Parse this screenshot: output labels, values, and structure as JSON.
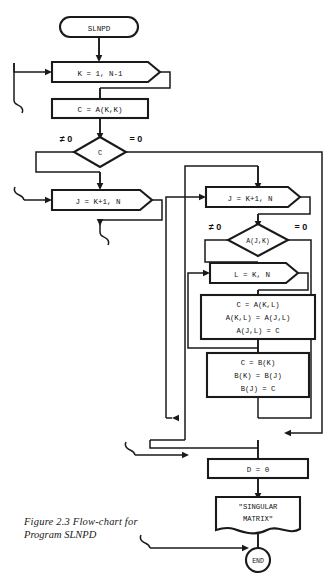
{
  "figure": {
    "caption_line1": "Figure 2.3    Flow-chart for",
    "caption_line2": "Program SLNPD",
    "title": "Flow-chart for Program SLNPD"
  },
  "colors": {
    "ink": "#1a1a1a",
    "paper": "#ffffff"
  },
  "nodes": {
    "start": "SLNPD",
    "loop_k": "K = 1, N-1",
    "assign_c": "C = A(K,K)",
    "decision_c": "C",
    "loop_j_left": "J = K+1, N",
    "loop_j_right": "J = K+1, N",
    "decision_ajk": "A(J,K)",
    "loop_l": "L = K, N",
    "swap_a_1": "C = A(K,L)",
    "swap_a_2": "A(K,L) = A(J,L)",
    "swap_a_3": "A(J,L) = C",
    "swap_b_1": "C = B(K)",
    "swap_b_2": "B(K) = B(J)",
    "swap_b_3": "B(J) = C",
    "assign_d": "D = 0",
    "output_line1": "\"SINGULAR",
    "output_line2": "MATRIX\"",
    "end": "END"
  },
  "branch_labels": {
    "c_not_zero": "≠ 0",
    "c_zero": "= 0",
    "ajk_not_zero": "≠ 0",
    "ajk_zero": "= 0"
  }
}
